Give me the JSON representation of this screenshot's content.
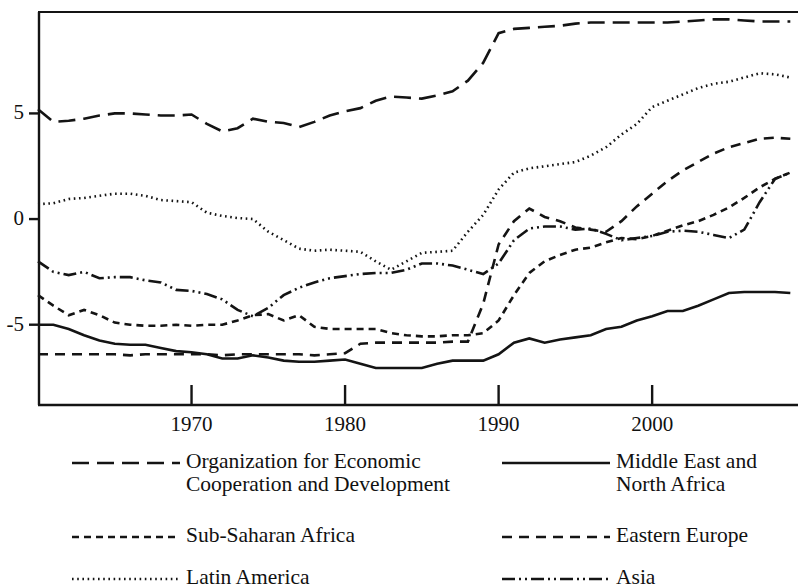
{
  "chart_data": {
    "type": "line",
    "title": "",
    "subtitle": "",
    "xlabel": "",
    "ylabel": "",
    "xlim": [
      1960,
      2009.5
    ],
    "ylim": [
      -8.8,
      9.8
    ],
    "xticks": [
      1970,
      1980,
      1990,
      2000
    ],
    "xtick_labels": [
      "1970",
      "1980",
      "1990",
      "2000"
    ],
    "yticks": [
      5,
      0,
      -5
    ],
    "ytick_labels": [
      "5",
      "0",
      "-5"
    ],
    "grid": false,
    "legend_position": "below",
    "axis_color": "#141414",
    "line_color": "#141414",
    "series": [
      {
        "name": "Organization for Economic Cooperation and Development",
        "short": "OECD",
        "style": "long-dash",
        "dasharray": "17,8",
        "width": 2.6,
        "x": [
          1960,
          1961,
          1962,
          1963,
          1964,
          1965,
          1966,
          1967,
          1968,
          1969,
          1970,
          1971,
          1972,
          1973,
          1974,
          1975,
          1976,
          1977,
          1978,
          1979,
          1980,
          1981,
          1982,
          1983,
          1984,
          1985,
          1986,
          1987,
          1988,
          1989,
          1990,
          1991,
          1992,
          1993,
          1994,
          1995,
          1996,
          1997,
          1998,
          1999,
          2000,
          2001,
          2002,
          2003,
          2004,
          2005,
          2006,
          2007,
          2008,
          2009
        ],
        "y": [
          5.2,
          4.6,
          4.65,
          4.75,
          4.9,
          5.0,
          5.0,
          4.95,
          4.9,
          4.9,
          4.95,
          4.5,
          4.15,
          4.3,
          4.75,
          4.6,
          4.55,
          4.35,
          4.6,
          4.9,
          5.1,
          5.25,
          5.6,
          5.8,
          5.75,
          5.7,
          5.85,
          6.05,
          6.55,
          7.4,
          8.8,
          9.0,
          9.05,
          9.1,
          9.15,
          9.25,
          9.3,
          9.3,
          9.3,
          9.3,
          9.3,
          9.3,
          9.35,
          9.4,
          9.45,
          9.45,
          9.4,
          9.35,
          9.35,
          9.35
        ]
      },
      {
        "name": "Latin America",
        "short": "Latin America",
        "style": "dotted",
        "dasharray": "1.6,3.6",
        "width": 2.6,
        "x": [
          1960,
          1961,
          1962,
          1963,
          1964,
          1965,
          1966,
          1967,
          1968,
          1969,
          1970,
          1971,
          1972,
          1973,
          1974,
          1975,
          1976,
          1977,
          1978,
          1979,
          1980,
          1981,
          1982,
          1983,
          1984,
          1985,
          1986,
          1987,
          1988,
          1989,
          1990,
          1991,
          1992,
          1993,
          1994,
          1995,
          1996,
          1997,
          1998,
          1999,
          2000,
          2001,
          2002,
          2003,
          2004,
          2005,
          2006,
          2007,
          2008,
          2009
        ],
        "y": [
          0.7,
          0.75,
          0.95,
          1.0,
          1.1,
          1.2,
          1.2,
          1.1,
          0.9,
          0.85,
          0.8,
          0.3,
          0.15,
          0.05,
          0.0,
          -0.6,
          -1.0,
          -1.4,
          -1.5,
          -1.45,
          -1.5,
          -1.55,
          -2.0,
          -2.4,
          -2.0,
          -1.6,
          -1.55,
          -1.5,
          -0.6,
          0.2,
          1.4,
          2.2,
          2.4,
          2.5,
          2.6,
          2.7,
          3.0,
          3.4,
          4.0,
          4.5,
          5.3,
          5.6,
          5.9,
          6.2,
          6.4,
          6.5,
          6.7,
          6.9,
          6.85,
          6.7
        ]
      },
      {
        "name": "Eastern Europe",
        "short": "Eastern Europe",
        "style": "medium-dash",
        "dasharray": "10,7",
        "width": 2.6,
        "x": [
          1960,
          1961,
          1962,
          1963,
          1964,
          1965,
          1966,
          1967,
          1968,
          1969,
          1970,
          1971,
          1972,
          1973,
          1974,
          1975,
          1976,
          1977,
          1978,
          1979,
          1980,
          1981,
          1982,
          1983,
          1984,
          1985,
          1986,
          1987,
          1988,
          1989,
          1990,
          1991,
          1992,
          1993,
          1994,
          1995,
          1996,
          1997,
          1998,
          1999,
          2000,
          2001,
          2002,
          2003,
          2004,
          2005,
          2006,
          2007,
          2008,
          2009
        ],
        "y": [
          -6.4,
          -6.4,
          -6.4,
          -6.4,
          -6.4,
          -6.4,
          -6.45,
          -6.4,
          -6.4,
          -6.4,
          -6.4,
          -6.4,
          -6.45,
          -6.4,
          -6.4,
          -6.4,
          -6.4,
          -6.4,
          -6.45,
          -6.4,
          -6.35,
          -5.9,
          -5.85,
          -5.85,
          -5.85,
          -5.85,
          -5.85,
          -5.8,
          -5.8,
          -4.0,
          -1.2,
          -0.1,
          0.5,
          0.1,
          -0.1,
          -0.4,
          -0.5,
          -0.6,
          -0.1,
          0.6,
          1.2,
          1.8,
          2.3,
          2.7,
          3.1,
          3.4,
          3.6,
          3.8,
          3.85,
          3.8
        ]
      },
      {
        "name": "Asia",
        "short": "Asia",
        "style": "dash-dot-dot",
        "dasharray": "13,4,2,4,2,4",
        "width": 2.6,
        "x": [
          1960,
          1961,
          1962,
          1963,
          1964,
          1965,
          1966,
          1967,
          1968,
          1969,
          1970,
          1971,
          1972,
          1973,
          1974,
          1975,
          1976,
          1977,
          1978,
          1979,
          1980,
          1981,
          1982,
          1983,
          1984,
          1985,
          1986,
          1987,
          1988,
          1989,
          1990,
          1991,
          1992,
          1993,
          1994,
          1995,
          1996,
          1997,
          1998,
          1999,
          2000,
          2001,
          2002,
          2003,
          2004,
          2005,
          2006,
          2007,
          2008,
          2009
        ],
        "y": [
          -2.0,
          -2.5,
          -2.65,
          -2.5,
          -2.8,
          -2.75,
          -2.75,
          -2.9,
          -3.0,
          -3.35,
          -3.4,
          -3.55,
          -3.8,
          -4.3,
          -4.6,
          -4.2,
          -3.6,
          -3.25,
          -3.0,
          -2.8,
          -2.7,
          -2.6,
          -2.55,
          -2.55,
          -2.4,
          -2.1,
          -2.1,
          -2.2,
          -2.4,
          -2.6,
          -2.1,
          -1.0,
          -0.45,
          -0.35,
          -0.35,
          -0.5,
          -0.45,
          -0.7,
          -1.0,
          -0.9,
          -0.8,
          -0.6,
          -0.55,
          -0.6,
          -0.75,
          -0.9,
          -0.5,
          0.8,
          1.9,
          2.2
        ]
      },
      {
        "name": "Sub-Saharan Africa",
        "short": "Sub-Saharan Africa",
        "style": "short-dash",
        "dasharray": "7,5",
        "width": 2.6,
        "x": [
          1960,
          1961,
          1962,
          1963,
          1964,
          1965,
          1966,
          1967,
          1968,
          1969,
          1970,
          1971,
          1972,
          1973,
          1974,
          1975,
          1976,
          1977,
          1978,
          1979,
          1980,
          1981,
          1982,
          1983,
          1984,
          1985,
          1986,
          1987,
          1988,
          1989,
          1990,
          1991,
          1992,
          1993,
          1994,
          1995,
          1996,
          1997,
          1998,
          1999,
          2000,
          2001,
          2002,
          2003,
          2004,
          2005,
          2006,
          2007,
          2008,
          2009
        ],
        "y": [
          -3.6,
          -4.1,
          -4.55,
          -4.3,
          -4.55,
          -4.9,
          -5.0,
          -5.05,
          -5.05,
          -5.0,
          -5.05,
          -5.0,
          -5.0,
          -4.8,
          -4.55,
          -4.5,
          -4.8,
          -4.55,
          -5.1,
          -5.2,
          -5.2,
          -5.2,
          -5.2,
          -5.4,
          -5.5,
          -5.55,
          -5.55,
          -5.5,
          -5.5,
          -5.4,
          -4.8,
          -3.6,
          -2.55,
          -2.0,
          -1.7,
          -1.45,
          -1.35,
          -1.1,
          -0.9,
          -0.95,
          -0.8,
          -0.55,
          -0.3,
          -0.1,
          0.2,
          0.55,
          1.0,
          1.5,
          1.9,
          2.2
        ]
      },
      {
        "name": "Middle East and North Africa",
        "short": "Middle East and North Africa",
        "style": "solid",
        "dasharray": "none",
        "width": 2.6,
        "x": [
          1960,
          1961,
          1962,
          1963,
          1964,
          1965,
          1966,
          1967,
          1968,
          1969,
          1970,
          1971,
          1972,
          1973,
          1974,
          1975,
          1976,
          1977,
          1978,
          1979,
          1980,
          1981,
          1982,
          1983,
          1984,
          1985,
          1986,
          1987,
          1988,
          1989,
          1990,
          1991,
          1992,
          1993,
          1994,
          1995,
          1996,
          1997,
          1998,
          1999,
          2000,
          2001,
          2002,
          2003,
          2004,
          2005,
          2006,
          2007,
          2008,
          2009
        ],
        "y": [
          -5.0,
          -5.0,
          -5.2,
          -5.5,
          -5.75,
          -5.9,
          -5.95,
          -5.95,
          -6.1,
          -6.25,
          -6.3,
          -6.4,
          -6.6,
          -6.6,
          -6.45,
          -6.55,
          -6.7,
          -6.75,
          -6.75,
          -6.7,
          -6.65,
          -6.85,
          -7.05,
          -7.05,
          -7.05,
          -7.05,
          -6.85,
          -6.7,
          -6.7,
          -6.7,
          -6.4,
          -5.85,
          -5.65,
          -5.85,
          -5.7,
          -5.6,
          -5.5,
          -5.2,
          -5.1,
          -4.8,
          -4.6,
          -4.35,
          -4.35,
          -4.1,
          -3.8,
          -3.5,
          -3.45,
          -3.45,
          -3.45,
          -3.5
        ]
      }
    ]
  },
  "legend": {
    "left_column": [
      {
        "label": "Organization for Economic\nCooperation and Development",
        "style": "long-dash",
        "dasharray": "17,8"
      },
      {
        "label": "Sub-Saharan Africa",
        "style": "short-dash",
        "dasharray": "7,5"
      },
      {
        "label": "Latin America",
        "style": "dotted",
        "dasharray": "1.6,3.6"
      }
    ],
    "right_column": [
      {
        "label": "Middle East and\nNorth Africa",
        "style": "solid",
        "dasharray": "none"
      },
      {
        "label": "Eastern Europe",
        "style": "medium-dash",
        "dasharray": "10,7"
      },
      {
        "label": "Asia",
        "style": "dash-dot-dot",
        "dasharray": "13,4,2,4,2,4"
      }
    ]
  }
}
